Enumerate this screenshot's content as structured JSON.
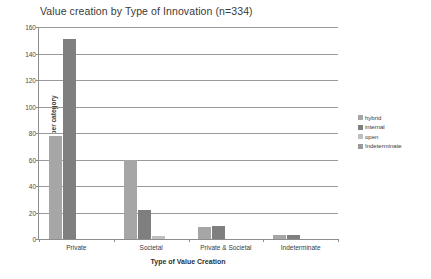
{
  "chart_data": {
    "type": "bar",
    "title": "Value creation by Type of Innovation (n=334)",
    "xlabel": "Type of Value Creation",
    "ylabel": "No of programs per category",
    "categories": [
      "Private",
      "Societal",
      "Private & Societal",
      "Indeterminate"
    ],
    "ylim": [
      0,
      160
    ],
    "yticks": [
      0,
      20,
      40,
      60,
      80,
      100,
      120,
      140,
      160
    ],
    "grid": true,
    "legend_position": "right",
    "series": [
      {
        "name": "hybrid",
        "color": "#a6a6a6",
        "values": [
          78,
          60,
          9,
          3
        ]
      },
      {
        "name": "internal",
        "color": "#7f7f7f",
        "values": [
          151,
          22,
          10,
          3
        ]
      },
      {
        "name": "open",
        "color": "#bfbfbf",
        "values": [
          0,
          2,
          0,
          0
        ]
      },
      {
        "name": "Indeterminate",
        "color": "#999999",
        "values": [
          0,
          0,
          0,
          0
        ]
      }
    ]
  },
  "legend": {
    "items": [
      {
        "label": "hybrid"
      },
      {
        "label": "internal"
      },
      {
        "label": "open"
      },
      {
        "label": "Indeterminate"
      }
    ]
  },
  "yticks_text": [
    "160",
    "140",
    "120",
    "100",
    "80",
    "60",
    "40",
    "20",
    "0"
  ]
}
